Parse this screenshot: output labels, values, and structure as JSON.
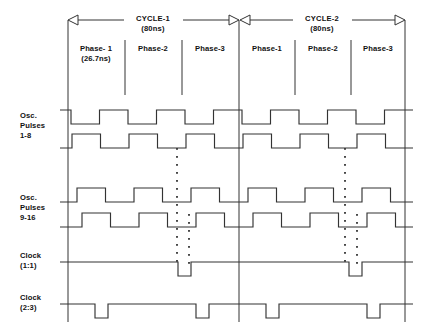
{
  "diagram": {
    "units": "ns",
    "cycles": [
      {
        "name": "CYCLE-1",
        "duration": "(80ns)",
        "phases": [
          {
            "name": "Phase- 1",
            "duration": "(26.7ns)"
          },
          {
            "name": "Phase-2",
            "duration": ""
          },
          {
            "name": "Phase-3",
            "duration": ""
          }
        ]
      },
      {
        "name": "CYCLE-2",
        "duration": "(80ns)",
        "phases": [
          {
            "name": "Phase-1",
            "duration": ""
          },
          {
            "name": "Phase-2",
            "duration": ""
          },
          {
            "name": "Phase-3",
            "duration": ""
          }
        ]
      }
    ],
    "signal_groups": [
      {
        "label_lines": [
          "Osc.",
          "Pulses",
          "1-8"
        ],
        "rows": [
          0,
          1
        ]
      },
      {
        "label_lines": [
          "Osc.",
          "Pulses",
          "9-16"
        ],
        "rows": [
          2,
          3
        ]
      },
      {
        "label_lines": [
          "Clock",
          "(1:1)"
        ],
        "rows": [
          4
        ]
      },
      {
        "label_lines": [
          "Clock",
          "(2:3)"
        ],
        "rows": [
          5
        ]
      }
    ],
    "ellipsis_markers": [
      {
        "x": 177,
        "y_from": 148,
        "y_to": 262,
        "note": "pulses 2..7 omitted"
      },
      {
        "x": 189,
        "y_from": 214,
        "y_to": 262,
        "note": "pulses 10..15 omitted"
      },
      {
        "x": 345,
        "y_from": 148,
        "y_to": 262,
        "note": "pulses 2..7 omitted"
      },
      {
        "x": 357,
        "y_from": 214,
        "y_to": 262,
        "note": "pulses 10..15 omitted"
      }
    ]
  },
  "chart_data": {
    "type": "line",
    "xlabel": "",
    "ylabel": "",
    "x_axis": {
      "unit": "ns",
      "cycle_period_ns": 80,
      "phase_period_ns": 26.7,
      "range_ns": [
        0,
        160
      ],
      "cycle_boundaries_px": [
        68,
        239,
        405
      ],
      "phase_boundaries_px": [
        68,
        125,
        182,
        239,
        295,
        351,
        405
      ]
    },
    "grid": false,
    "legend": "left-row-labels",
    "series": [
      {
        "name": "Osc. Pulses 1-8 (pulse 1)",
        "row": 0,
        "type": "digital",
        "initial_level": "high",
        "pulses_per_cycle": 3,
        "duty": "50%"
      },
      {
        "name": "Osc. Pulses 1-8 (pulse 8)",
        "row": 1,
        "type": "digital",
        "initial_level": "low",
        "pulses_per_cycle": 3,
        "duty": "50%",
        "phase_shift": "delayed"
      },
      {
        "name": "Osc. Pulses 9-16 (pulse 9)",
        "row": 2,
        "type": "digital",
        "initial_level": "low",
        "pulses_per_cycle": 3,
        "duty": "50%"
      },
      {
        "name": "Osc. Pulses 9-16 (pulse 16)",
        "row": 3,
        "type": "digital",
        "initial_level": "low",
        "pulses_per_cycle": 3,
        "duty": "50%",
        "phase_shift": "delayed"
      },
      {
        "name": "Clock (1:1)",
        "row": 4,
        "type": "digital",
        "initial_level": "high",
        "low_pulses_per_cycle": 1,
        "duty": "narrow-low"
      },
      {
        "name": "Clock (2:3)",
        "row": 5,
        "type": "digital",
        "initial_level": "high",
        "low_pulses_per_cycle": 2,
        "duty": "narrow-low"
      }
    ]
  },
  "colors": {
    "background": "#ffffff",
    "ink": "#333333",
    "text": "#111111"
  }
}
